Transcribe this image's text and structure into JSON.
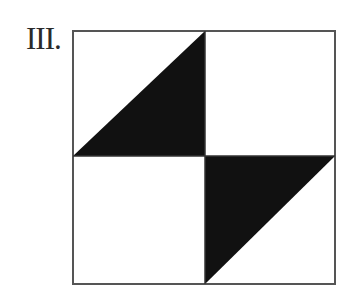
{
  "figure": {
    "label": "III.",
    "square": {
      "x": 73,
      "y": 31,
      "width": 262,
      "height": 253
    },
    "center": {
      "x": 205,
      "y": 156
    },
    "colors": {
      "background": "#ffffff",
      "fill": "#111111",
      "stroke": "#555555"
    },
    "shaded_triangles": [
      {
        "name": "upper-left-quadrant-lower-right-triangle",
        "points": "73,156 205,31 205,156"
      },
      {
        "name": "lower-right-quadrant-upper-left-triangle",
        "points": "205,156 335,156 205,284"
      }
    ]
  }
}
